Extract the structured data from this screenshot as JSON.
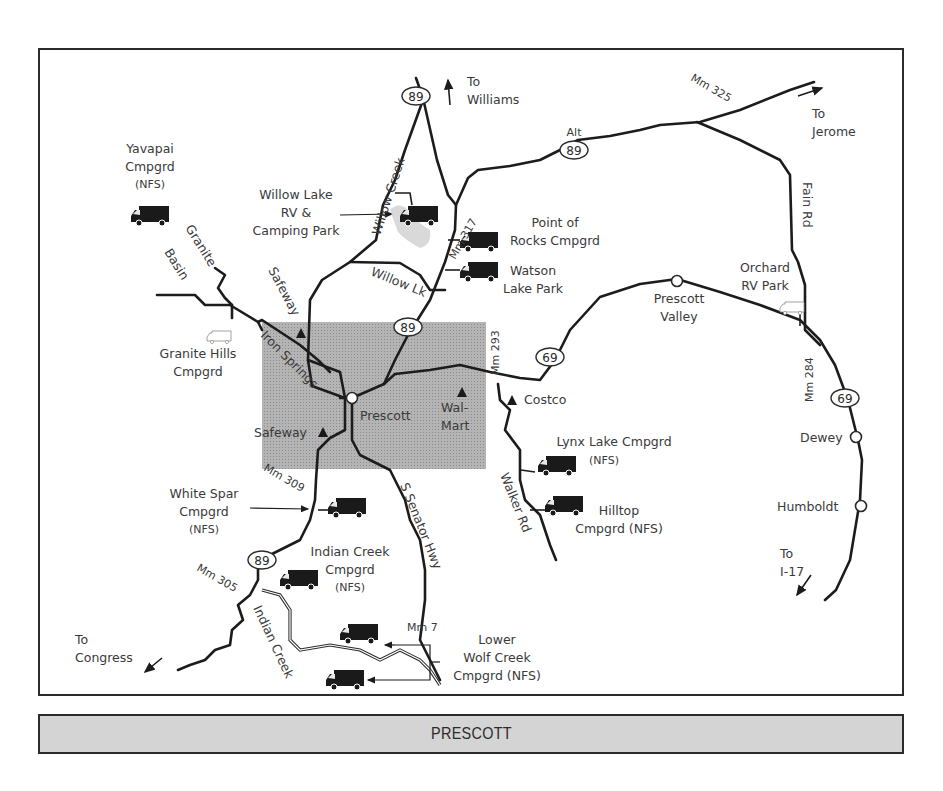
{
  "map": {
    "title": "PRESCOTT",
    "colors": {
      "frame": "#2b2b2b",
      "city_area": "#a9a9a9",
      "footer_band": "#d4d4d4",
      "road": "#1c1c1c",
      "text": "#3a3a3a"
    },
    "city": {
      "name": "Prescott"
    },
    "highways": [
      {
        "id": "hwy-89-north",
        "label": "89"
      },
      {
        "id": "hwy-alt-89",
        "prefix": "Alt",
        "label": "89"
      },
      {
        "id": "hwy-89-central",
        "label": "89"
      },
      {
        "id": "hwy-69-west",
        "label": "69"
      },
      {
        "id": "hwy-69-east",
        "label": "69"
      },
      {
        "id": "hwy-89-south",
        "label": "89"
      }
    ],
    "mileposts": [
      "Mm 325",
      "Mm 317",
      "Mm 293",
      "Mm 284",
      "Mm 309",
      "Mm 305",
      "Mm 7"
    ],
    "roads": [
      "Willow Creek",
      "Willow Lk",
      "Granite",
      "Basin",
      "Safeway",
      "Iron Springs",
      "Fain Rd",
      "Walker Rd",
      "S Senator Hwy",
      "Indian Creek"
    ],
    "directions": [
      {
        "line1": "To",
        "line2": "Williams"
      },
      {
        "line1": "To",
        "line2": "Jerome"
      },
      {
        "line1": "To",
        "line2": "I-17"
      },
      {
        "line1": "To",
        "line2": "Congress"
      }
    ],
    "towns": [
      "Prescott",
      "Prescott Valley",
      "Dewey",
      "Humboldt"
    ],
    "stores": [
      "Safeway",
      "Safeway",
      "Wal-",
      "Mart",
      "Costco"
    ],
    "campgrounds": [
      {
        "lines": [
          "Yavapai",
          "Cmpgrd",
          "(NFS)"
        ]
      },
      {
        "lines": [
          "Willow Lake",
          "RV &",
          "Camping Park"
        ]
      },
      {
        "lines": [
          "Point of",
          "Rocks Cmpgrd"
        ]
      },
      {
        "lines": [
          "Watson",
          "Lake Park"
        ]
      },
      {
        "lines": [
          "Granite Hills",
          "Cmpgrd"
        ]
      },
      {
        "lines": [
          "Orchard",
          "RV Park"
        ]
      },
      {
        "lines": [
          "Lynx Lake Cmpgrd",
          "(NFS)"
        ]
      },
      {
        "lines": [
          "Hilltop",
          "Cmpgrd (NFS)"
        ]
      },
      {
        "lines": [
          "White Spar",
          "Cmpgrd",
          "(NFS)"
        ]
      },
      {
        "lines": [
          "Indian Creek",
          "Cmpgrd",
          "(NFS)"
        ]
      },
      {
        "lines": [
          "Lower",
          "Wolf Creek",
          "Cmpgrd (NFS)"
        ]
      }
    ]
  }
}
